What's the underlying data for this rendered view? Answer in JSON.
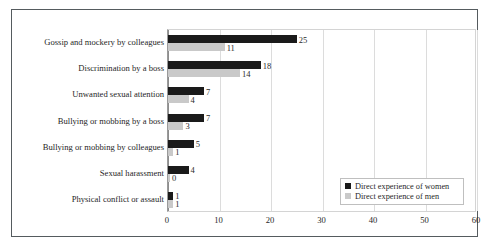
{
  "top_sliver_text": "",
  "chart_data": {
    "type": "bar",
    "orientation": "horizontal",
    "title": "",
    "subtitle": "",
    "xlabel": "",
    "ylabel": "",
    "xlim": [
      0,
      60
    ],
    "ylim": null,
    "grid": true,
    "legend_position": "inside-bottom-right",
    "categories": [
      "Gossip and mockery by colleagues",
      "Discrimination by a boss",
      "Unwanted sexual attention",
      "Bullying or mobbing by a boss",
      "Bullying or mobbing by colleagues",
      "Sexual harassment",
      "Physical conflict or assault"
    ],
    "xticks": [
      "0",
      "10",
      "20",
      "30",
      "40",
      "50",
      "60"
    ],
    "xtick_values": [
      0,
      10,
      20,
      30,
      40,
      50,
      60
    ],
    "series": [
      {
        "name": "Direct experience of women",
        "color": "#1a1a1a",
        "values": [
          25,
          18,
          7,
          7,
          5,
          4,
          1
        ],
        "labels": [
          "25",
          "18",
          "7",
          "7",
          "5",
          "4",
          "1"
        ]
      },
      {
        "name": "Direct experience of men",
        "color": "#c9c9c9",
        "values": [
          11,
          14,
          4,
          3,
          1,
          0,
          1
        ],
        "labels": [
          "11",
          "14",
          "4",
          "3",
          "1",
          "0",
          "1"
        ]
      }
    ]
  }
}
